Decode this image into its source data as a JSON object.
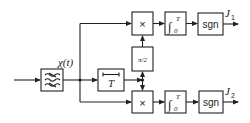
{
  "diagram": {
    "input_signal_label": "χ(t)",
    "blocks": {
      "filter": {
        "label": "≈",
        "symbol": "bandpass-filter"
      },
      "delay": {
        "label": "T"
      },
      "multiplier_top": {
        "label": "×"
      },
      "multiplier_bottom": {
        "label": "×"
      },
      "phase_shift": {
        "label": "π/2"
      },
      "integrator_top": {
        "label": "∫",
        "upper": "T",
        "lower": "0"
      },
      "integrator_bottom": {
        "label": "∫",
        "upper": "T",
        "lower": "0"
      },
      "sgn_top": {
        "label": "sgn"
      },
      "sgn_bottom": {
        "label": "sgn"
      }
    },
    "outputs": {
      "top": {
        "label": "J",
        "sub": "1"
      },
      "bottom": {
        "label": "J",
        "sub": "2"
      }
    },
    "colors": {
      "stroke": "#222222",
      "background": "#ffffff"
    }
  }
}
